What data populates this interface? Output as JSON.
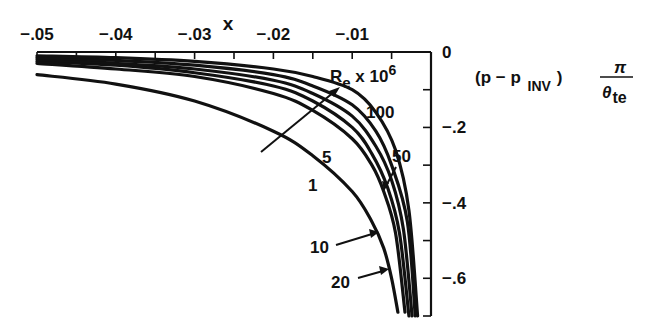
{
  "chart_data": {
    "type": "line",
    "title": "",
    "xlabel": "x",
    "ylabel": "(p − p_INV) π/θ_te",
    "ylabel_parts": {
      "open": "(p − p",
      "sub": "INV",
      "close": ")",
      "num": "π",
      "den": "θ",
      "den_sub": "te"
    },
    "xlim": [
      -0.05,
      0
    ],
    "ylim": [
      -0.7,
      0
    ],
    "x_ticks": [
      -0.05,
      -0.04,
      -0.03,
      -0.02,
      -0.01,
      0
    ],
    "x_tick_labels": [
      "-.05",
      "-.04",
      "-.03",
      "-.02",
      "-.01"
    ],
    "y_ticks": [
      0,
      -0.1,
      -0.2,
      -0.3,
      -0.4,
      -0.5,
      -0.6,
      -0.7
    ],
    "y_tick_labels": [
      "0",
      "-.2",
      "-.4",
      "-.6"
    ],
    "grid": false,
    "x_axis_position": "top",
    "y_axis_position": "right",
    "legend_title": "Re x 10^6",
    "legend_title_parts": {
      "base": "R",
      "sub": "e",
      "mid": " x 10",
      "sup": "6"
    },
    "series": [
      {
        "name": "1",
        "x": [
          -0.05,
          -0.04,
          -0.03,
          -0.02,
          -0.015,
          -0.01,
          -0.0075,
          -0.006,
          -0.005,
          -0.0042
        ],
        "y": [
          -0.06,
          -0.085,
          -0.13,
          -0.21,
          -0.275,
          -0.37,
          -0.45,
          -0.52,
          -0.6,
          -0.69
        ]
      },
      {
        "name": "5",
        "x": [
          -0.05,
          -0.04,
          -0.03,
          -0.02,
          -0.015,
          -0.01,
          -0.0075,
          -0.006,
          -0.0045,
          -0.0033
        ],
        "y": [
          -0.03,
          -0.045,
          -0.065,
          -0.11,
          -0.155,
          -0.23,
          -0.3,
          -0.37,
          -0.48,
          -0.69
        ]
      },
      {
        "name": "10",
        "x": [
          -0.05,
          -0.04,
          -0.03,
          -0.02,
          -0.015,
          -0.01,
          -0.0075,
          -0.0055,
          -0.004,
          -0.0028
        ],
        "y": [
          -0.025,
          -0.035,
          -0.055,
          -0.09,
          -0.13,
          -0.2,
          -0.27,
          -0.36,
          -0.48,
          -0.7
        ]
      },
      {
        "name": "20",
        "x": [
          -0.05,
          -0.04,
          -0.03,
          -0.02,
          -0.015,
          -0.01,
          -0.007,
          -0.005,
          -0.0035,
          -0.0024
        ],
        "y": [
          -0.02,
          -0.03,
          -0.045,
          -0.075,
          -0.11,
          -0.17,
          -0.25,
          -0.34,
          -0.47,
          -0.7
        ]
      },
      {
        "name": "50",
        "x": [
          -0.05,
          -0.04,
          -0.03,
          -0.02,
          -0.015,
          -0.01,
          -0.007,
          -0.005,
          -0.003,
          -0.002
        ],
        "y": [
          -0.015,
          -0.022,
          -0.035,
          -0.06,
          -0.09,
          -0.14,
          -0.21,
          -0.3,
          -0.45,
          -0.7
        ]
      },
      {
        "name": "100",
        "x": [
          -0.05,
          -0.04,
          -0.03,
          -0.02,
          -0.015,
          -0.01,
          -0.007,
          -0.0045,
          -0.0028,
          -0.0017
        ],
        "y": [
          -0.01,
          -0.015,
          -0.025,
          -0.045,
          -0.065,
          -0.1,
          -0.16,
          -0.26,
          -0.42,
          -0.7
        ]
      }
    ],
    "annotations": [
      {
        "text": "1",
        "pointer": false
      },
      {
        "text": "5",
        "pointer": false
      },
      {
        "text": "10",
        "pointer": true
      },
      {
        "text": "20",
        "pointer": true
      },
      {
        "text": "50",
        "pointer": true
      },
      {
        "text": "100",
        "pointer": false
      },
      {
        "text": "Re x 10^6",
        "pointer": "arrow across curves indicating increasing Re"
      }
    ],
    "colors": {
      "ink": "#111111",
      "background": "#ffffff"
    }
  }
}
